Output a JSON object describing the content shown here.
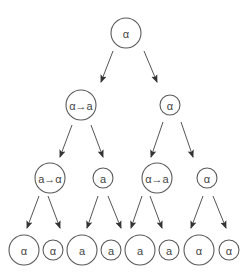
{
  "diagram": {
    "type": "tree",
    "colors": {
      "stroke": "#5a5a5a",
      "text": "#444444",
      "background": "#ffffff"
    },
    "nodes": [
      {
        "id": "n0",
        "label": "α",
        "cx": 126,
        "cy": 33,
        "r": 15,
        "level": 0
      },
      {
        "id": "n1",
        "label": "α→a",
        "cx": 81,
        "cy": 105,
        "r": 15,
        "level": 1
      },
      {
        "id": "n2",
        "label": "α",
        "cx": 170,
        "cy": 105,
        "r": 10,
        "level": 1
      },
      {
        "id": "n3",
        "label": "a→α",
        "cx": 50,
        "cy": 178,
        "r": 15,
        "level": 2
      },
      {
        "id": "n4",
        "label": "a",
        "cx": 103,
        "cy": 178,
        "r": 10,
        "level": 2
      },
      {
        "id": "n5",
        "label": "α→a",
        "cx": 157,
        "cy": 178,
        "r": 15,
        "level": 2
      },
      {
        "id": "n6",
        "label": "α",
        "cx": 207,
        "cy": 178,
        "r": 10,
        "level": 2
      },
      {
        "id": "n7",
        "label": "α",
        "cx": 24,
        "cy": 250,
        "r": 15,
        "level": 3
      },
      {
        "id": "n8",
        "label": "α",
        "cx": 53,
        "cy": 250,
        "r": 10,
        "level": 3
      },
      {
        "id": "n9",
        "label": "a",
        "cx": 82,
        "cy": 250,
        "r": 15,
        "level": 3
      },
      {
        "id": "n10",
        "label": "a",
        "cx": 111,
        "cy": 250,
        "r": 10,
        "level": 3
      },
      {
        "id": "n11",
        "label": "a",
        "cx": 140,
        "cy": 250,
        "r": 15,
        "level": 3
      },
      {
        "id": "n12",
        "label": "a",
        "cx": 169,
        "cy": 250,
        "r": 10,
        "level": 3
      },
      {
        "id": "n13",
        "label": "α",
        "cx": 199,
        "cy": 250,
        "r": 15,
        "level": 3
      },
      {
        "id": "n14",
        "label": "α",
        "cx": 229,
        "cy": 250,
        "r": 10,
        "level": 3
      }
    ],
    "edges": [
      {
        "from": "n0",
        "to": "n1",
        "x1": 113,
        "y1": 51,
        "x2": 101,
        "y2": 82
      },
      {
        "from": "n0",
        "to": "n2",
        "x1": 144,
        "y1": 51,
        "x2": 157,
        "y2": 82
      },
      {
        "from": "n1",
        "to": "n3",
        "x1": 72,
        "y1": 125,
        "x2": 60,
        "y2": 157
      },
      {
        "from": "n1",
        "to": "n4",
        "x1": 91,
        "y1": 125,
        "x2": 103,
        "y2": 157
      },
      {
        "from": "n2",
        "to": "n5",
        "x1": 163,
        "y1": 122,
        "x2": 151,
        "y2": 157
      },
      {
        "from": "n2",
        "to": "n6",
        "x1": 181,
        "y1": 122,
        "x2": 193,
        "y2": 157
      },
      {
        "from": "n3",
        "to": "n7",
        "x1": 39,
        "y1": 196,
        "x2": 27,
        "y2": 228
      },
      {
        "from": "n3",
        "to": "n8",
        "x1": 48,
        "y1": 196,
        "x2": 60,
        "y2": 228
      },
      {
        "from": "n4",
        "to": "n9",
        "x1": 98,
        "y1": 196,
        "x2": 87,
        "y2": 228
      },
      {
        "from": "n4",
        "to": "n10",
        "x1": 108,
        "y1": 196,
        "x2": 121,
        "y2": 228
      },
      {
        "from": "n5",
        "to": "n11",
        "x1": 142,
        "y1": 196,
        "x2": 131,
        "y2": 228
      },
      {
        "from": "n5",
        "to": "n12",
        "x1": 150,
        "y1": 196,
        "x2": 162,
        "y2": 228
      },
      {
        "from": "n6",
        "to": "n13",
        "x1": 203,
        "y1": 196,
        "x2": 191,
        "y2": 228
      },
      {
        "from": "n6",
        "to": "n14",
        "x1": 213,
        "y1": 196,
        "x2": 226,
        "y2": 228
      }
    ]
  }
}
